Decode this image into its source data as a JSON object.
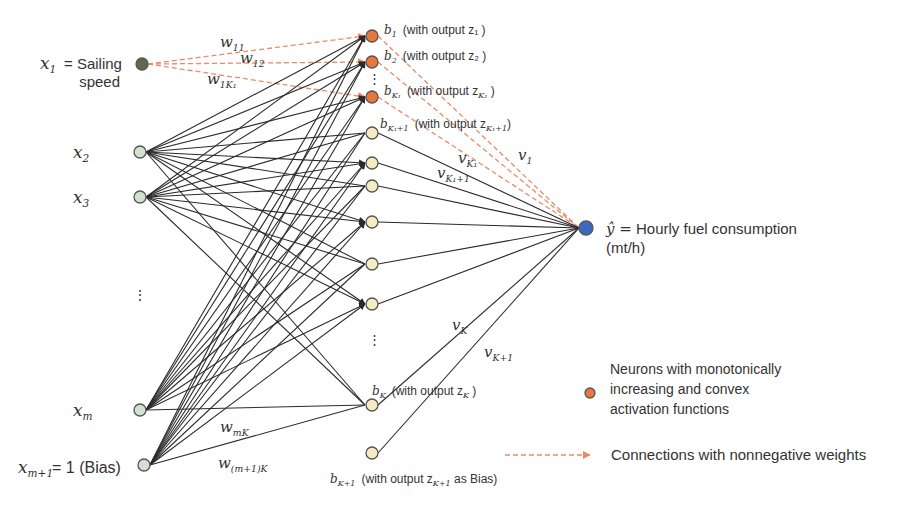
{
  "colors": {
    "input_node": "#d3e2cf",
    "input_node_x1": "#5c6b4a",
    "hidden_convex_node": "#e8763d",
    "hidden_node": "#f5ecc2",
    "output_node": "#3b6bbf",
    "edge": "#2b2b2b",
    "nonneg_edge": "#e98a6a"
  },
  "input_layer": {
    "nodes": [
      {
        "id": "x1",
        "x": 142,
        "y": 64,
        "type": "special",
        "label": "x",
        "sub": "1",
        "suffix": " = Sailing",
        "suffix2": "speed"
      },
      {
        "id": "x2",
        "x": 140,
        "y": 152,
        "type": "normal",
        "label": "x",
        "sub": "2"
      },
      {
        "id": "x3",
        "x": 140,
        "y": 197,
        "type": "normal",
        "label": "x",
        "sub": "3"
      },
      {
        "id": "xm",
        "x": 140,
        "y": 410,
        "type": "normal",
        "label": "x",
        "sub": "m"
      },
      {
        "id": "xm1",
        "x": 144,
        "y": 465,
        "type": "normal",
        "label": "x",
        "sub": "m+1",
        "suffix": " = 1 (Bias)"
      }
    ],
    "ellipsis": "⋮"
  },
  "hidden_layer": {
    "nodes": [
      {
        "id": "b1",
        "x": 372,
        "y": 36,
        "type": "convex",
        "text": "(with output z₁ )",
        "name": "b",
        "sub": "1"
      },
      {
        "id": "b2",
        "x": 372,
        "y": 62,
        "type": "convex",
        "text": "(with output z₂ )",
        "name": "b",
        "sub": "2"
      },
      {
        "id": "bK1",
        "x": 372,
        "y": 97,
        "type": "convex",
        "text": "(with output z",
        "text_sub": "K₁",
        "text_end": " )",
        "name": "b",
        "sub": "K₁"
      },
      {
        "id": "bK1p1",
        "x": 372,
        "y": 133,
        "type": "normal",
        "text": "(with output z",
        "text_sub": "K₁+1",
        "text_end": ")",
        "name": "b",
        "sub": "K₁+1"
      },
      {
        "id": "h5",
        "x": 372,
        "y": 163,
        "type": "normal"
      },
      {
        "id": "h6",
        "x": 372,
        "y": 186,
        "type": "normal"
      },
      {
        "id": "h7",
        "x": 372,
        "y": 222,
        "type": "normal"
      },
      {
        "id": "h8",
        "x": 372,
        "y": 264,
        "type": "normal"
      },
      {
        "id": "h9",
        "x": 372,
        "y": 304,
        "type": "normal"
      },
      {
        "id": "bK",
        "x": 372,
        "y": 405,
        "type": "normal",
        "text": "(with output z",
        "text_sub": "K",
        "text_end": " )",
        "name": "b",
        "sub": "K"
      },
      {
        "id": "bK1bias",
        "x": 372,
        "y": 453,
        "type": "normal",
        "text": "(with output z",
        "text_sub": "K+1",
        "text_end": " as Bias)",
        "name": "b",
        "sub": "K+1"
      }
    ],
    "ellipsis": "⋮"
  },
  "output_node": {
    "x": 586,
    "y": 228,
    "label_prefix": "ŷ =",
    "label": "Hourly fuel consumption",
    "label_line2": "(mt/h)"
  },
  "weight_labels": [
    {
      "text": "w",
      "sub": "11",
      "x": 220,
      "y": 47
    },
    {
      "text": "w",
      "sub": "12",
      "x": 240,
      "y": 63
    },
    {
      "text": "w",
      "sub": "1K₁",
      "x": 207,
      "y": 84
    },
    {
      "text": "w",
      "sub": "mK",
      "x": 220,
      "y": 432
    },
    {
      "text": "w",
      "sub": "(m+1)K",
      "x": 218,
      "y": 468
    },
    {
      "text": "v",
      "sub": "1",
      "x": 518,
      "y": 160
    },
    {
      "text": "v",
      "sub": "K₁",
      "x": 458,
      "y": 163
    },
    {
      "text": "v",
      "sub": "K₁+1",
      "x": 437,
      "y": 178
    },
    {
      "text": "v",
      "sub": "K",
      "x": 452,
      "y": 330
    },
    {
      "text": "v",
      "sub": "K+1",
      "x": 484,
      "y": 357
    }
  ],
  "legend": {
    "items": [
      {
        "marker": "orange-dot",
        "lines": [
          "Neurons with monotonically",
          "increasing and convex",
          "activation functions"
        ]
      },
      {
        "marker": "dashed-arrow",
        "lines": [
          "Connections with nonnegative weights"
        ]
      }
    ]
  }
}
